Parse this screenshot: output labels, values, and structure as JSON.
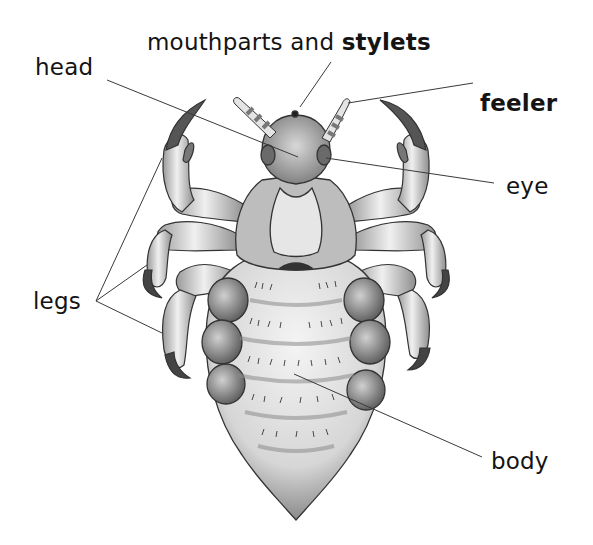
{
  "diagram": {
    "labels": [
      {
        "id": "mouthparts",
        "prefix": "mouthparts and ",
        "emphasis": "stylets",
        "x": 147,
        "y": 31
      },
      {
        "id": "head",
        "text": "head",
        "x": 35,
        "y": 56
      },
      {
        "id": "feeler",
        "text": "feeler",
        "x": 480,
        "y": 92,
        "bold": true
      },
      {
        "id": "eye",
        "text": "eye",
        "x": 506,
        "y": 175
      },
      {
        "id": "legs",
        "text": "legs",
        "x": 33,
        "y": 290
      },
      {
        "id": "body",
        "text": "body",
        "x": 491,
        "y": 450
      }
    ],
    "leader_lines": [
      {
        "label": "mouthparts and stylets",
        "from": [
          331,
          62
        ],
        "to": [
          300,
          107
        ]
      },
      {
        "label": "head",
        "from": [
          107,
          80
        ],
        "to": [
          298,
          157
        ]
      },
      {
        "label": "feeler",
        "from": [
          473,
          83
        ],
        "to": [
          348,
          103
        ]
      },
      {
        "label": "eye",
        "from": [
          494,
          183
        ],
        "to": [
          326,
          158
        ]
      },
      {
        "label": "legs",
        "from": [
          96,
          301
        ],
        "to": [
          162,
          158
        ]
      },
      {
        "label": "legs",
        "from": [
          96,
          301
        ],
        "to": [
          147,
          265
        ]
      },
      {
        "label": "legs",
        "from": [
          96,
          301
        ],
        "to": [
          162,
          333
        ]
      },
      {
        "label": "body",
        "from": [
          482,
          457
        ],
        "to": [
          294,
          374
        ]
      }
    ],
    "colors": {
      "line": "#3a3a3a",
      "text": "#141414",
      "background": "#ffffff"
    }
  }
}
